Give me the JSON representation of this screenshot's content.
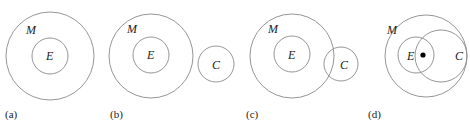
{
  "panels": [
    {
      "caption": "(a)",
      "labels": {
        "outer": "M",
        "inner": "E"
      }
    },
    {
      "caption": "(b)",
      "labels": {
        "outer": "M",
        "inner": "E",
        "third": "C"
      }
    },
    {
      "caption": "(c)",
      "labels": {
        "outer": "M",
        "inner": "E",
        "third": "C"
      }
    },
    {
      "caption": "(d)",
      "labels": {
        "outer": "M",
        "inner": "E",
        "third": "C"
      }
    }
  ],
  "colors": {
    "stroke": "#8a8a8a",
    "text": "#222222",
    "dot": "#000000"
  }
}
